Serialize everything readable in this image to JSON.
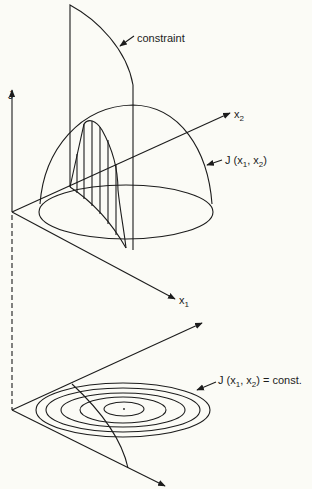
{
  "top_plot": {
    "axes": {
      "vertical": {
        "label": "J"
      },
      "depth": {
        "label": "x",
        "subscript": "2"
      },
      "horizontal": {
        "label": "x",
        "subscript": "1"
      }
    },
    "labels": {
      "constraint": "constraint",
      "surface_prefix": "J (x",
      "surface_sub1": "1",
      "surface_mid": ", x",
      "surface_sub2": "2",
      "surface_suffix": ")"
    }
  },
  "bottom_plot": {
    "contour_count": 5,
    "labels": {
      "contour_prefix": "J (x",
      "contour_sub1": "1",
      "contour_mid": ", x",
      "contour_sub2": "2",
      "contour_suffix": ") = const."
    }
  },
  "colors": {
    "ink": "#1c1c1c",
    "paper": "#fbfbf6"
  }
}
